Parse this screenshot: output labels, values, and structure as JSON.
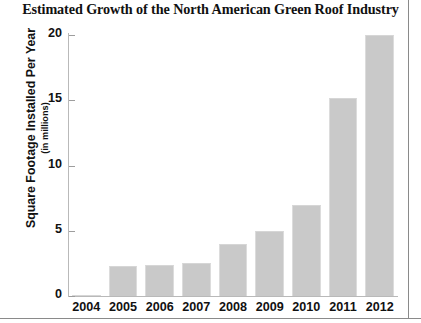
{
  "chart_data": {
    "type": "bar",
    "title": "Estimated Growth of the North American Green Roof Industry",
    "xlabel": "",
    "ylabel": "Square Footage Installed Per Year",
    "ylabel_sub": "(in millions)",
    "categories": [
      "2004",
      "2005",
      "2006",
      "2007",
      "2008",
      "2009",
      "2010",
      "2011",
      "2012"
    ],
    "values": [
      0.1,
      2.3,
      2.4,
      2.5,
      4.0,
      5.0,
      7.0,
      15.2,
      20.0
    ],
    "ylim": [
      0,
      20
    ],
    "yticks": [
      0,
      5,
      10,
      15,
      20
    ],
    "ytick_labels": [
      "0",
      "5",
      "10",
      "15",
      "20"
    ],
    "grid": false,
    "legend": false,
    "bar_color": "#c9c9c9",
    "axis_color": "#b9b9b9",
    "text_color": "#111111"
  }
}
